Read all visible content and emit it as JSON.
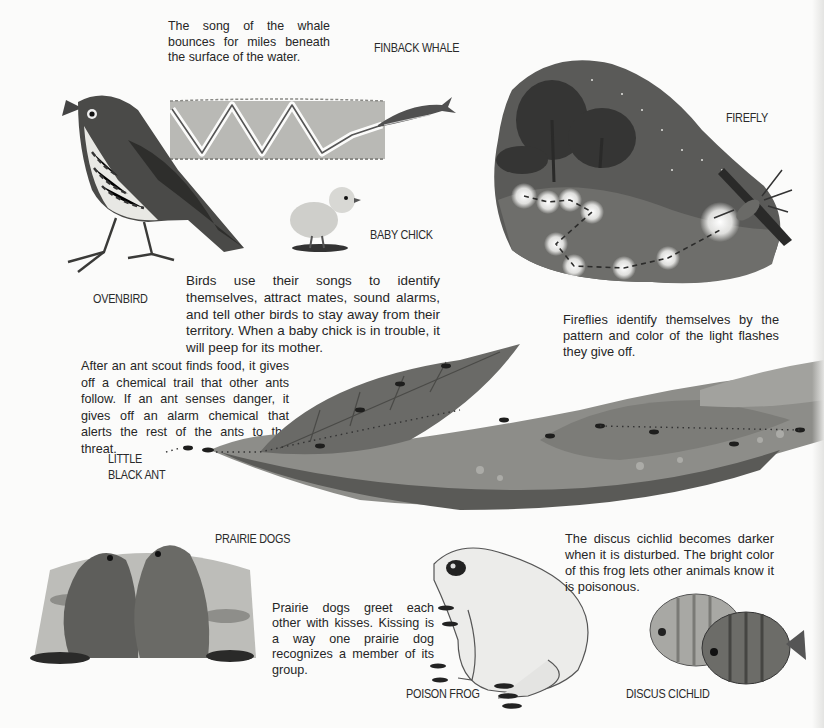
{
  "page": {
    "background": "#fbfbfa",
    "text_color": "#262626"
  },
  "whale": {
    "label": "FINBACK WHALE",
    "caption": "The song of the whale bounces for miles beneath the surface of the water.",
    "water_color": "#b9b9b5",
    "wave_color": "#fbfbfa"
  },
  "ovenbird": {
    "label": "OVENBIRD"
  },
  "chick": {
    "label": "BABY CHICK"
  },
  "birds": {
    "caption": "Birds use their songs to identify themselves, attract mates, sound alarms, and tell other birds to stay away from their territory. When a baby chick is in trouble, it will peep for its mother."
  },
  "firefly": {
    "label": "FIREFLY",
    "caption": "Fireflies identify themselves by the pattern and color of the light flashes they give off.",
    "night_color": "#5a5a58",
    "glow_color": "#f2f2ee"
  },
  "ants": {
    "label": "LITTLE\nBLACK ANT",
    "caption": "After an ant scout finds food, it gives off a chemical trail that other ants follow. If an ant senses danger, it gives off an alarm chemical that alerts the rest of the ants to the threat.",
    "leaf_color": "#8c8c88",
    "leaf_dark": "#4e4e4b"
  },
  "prairie_dogs": {
    "label": "PRAIRIE DOGS",
    "caption": "Prairie dogs greet each other with kisses. Kissing is a way one prairie dog recognizes a member of its group.",
    "fur_color": "#6b6b67"
  },
  "frog": {
    "label": "POISON FROG",
    "skin_color": "#ececea"
  },
  "discus": {
    "label": "DISCUS CICHLID",
    "caption": "The discus cichlid becomes darker when it is disturbed. The bright color of this frog lets other animals know it is poisonous.",
    "light_fish": "#a8a8a4",
    "dark_fish": "#6c6c68"
  }
}
